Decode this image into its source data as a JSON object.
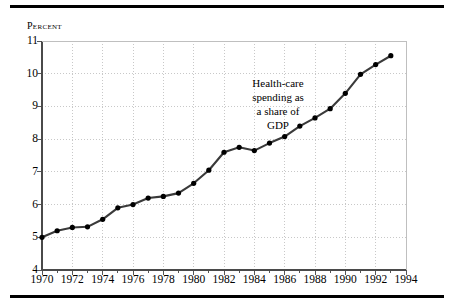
{
  "figure": {
    "percent_axis_label": "Percent",
    "annotation_lines": [
      "Health-care",
      "spending as",
      "a share of",
      "GDP"
    ],
    "line_color": "#3a3a3a",
    "marker_color": "#000000",
    "grid_color": "#c8c8c8",
    "axis_color": "#555555",
    "rule_color": "#000000",
    "background": "#ffffff"
  },
  "chart_data": {
    "type": "line",
    "title": "",
    "subtitle": "",
    "xlabel": "",
    "ylabel": "Percent",
    "annotation": "Health-care spending as a share of GDP",
    "xlim": [
      1970,
      1994
    ],
    "ylim": [
      4,
      11
    ],
    "ytick_values": [
      4,
      5,
      6,
      7,
      8,
      9,
      10,
      11
    ],
    "ytick_labels": [
      "4",
      "5",
      "6",
      "7",
      "8",
      "9",
      "10",
      "11"
    ],
    "xtick_values": [
      1970,
      1972,
      1974,
      1976,
      1978,
      1980,
      1982,
      1984,
      1986,
      1988,
      1990,
      1992,
      1994
    ],
    "xtick_labels": [
      "1970",
      "1972",
      "1974",
      "1976",
      "1978",
      "1980",
      "1982",
      "1984",
      "1986",
      "1988",
      "1990",
      "1992",
      "1994"
    ],
    "xminor_step": 1,
    "grid": true,
    "grid_style": "dotted",
    "legend": false,
    "markers": true,
    "x": [
      1970,
      1971,
      1972,
      1973,
      1974,
      1975,
      1976,
      1977,
      1978,
      1979,
      1980,
      1981,
      1982,
      1983,
      1984,
      1985,
      1986,
      1987,
      1988,
      1989,
      1990,
      1991,
      1992,
      1993
    ],
    "values": [
      5.0,
      5.2,
      5.3,
      5.32,
      5.55,
      5.9,
      6.0,
      6.2,
      6.25,
      6.35,
      6.65,
      7.05,
      7.6,
      7.75,
      7.65,
      7.88,
      8.08,
      8.4,
      8.65,
      8.93,
      9.4,
      9.98,
      10.28,
      10.55
    ],
    "series": [
      {
        "name": "Health-care spending as a share of GDP",
        "values": [
          5.0,
          5.2,
          5.3,
          5.32,
          5.55,
          5.9,
          6.0,
          6.2,
          6.25,
          6.35,
          6.65,
          7.05,
          7.6,
          7.75,
          7.65,
          7.88,
          8.08,
          8.4,
          8.65,
          8.93,
          9.4,
          9.98,
          10.28,
          10.55
        ]
      }
    ]
  }
}
